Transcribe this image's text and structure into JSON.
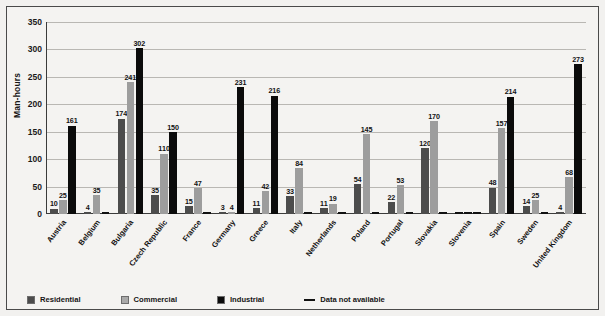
{
  "chart_data": {
    "type": "bar",
    "title": "",
    "xlabel": "",
    "ylabel": "Man-hours",
    "ylim": [
      0,
      350
    ],
    "yticks": [
      0,
      50,
      100,
      150,
      200,
      250,
      300,
      350
    ],
    "ytick_labels": [
      "0",
      "50",
      "100",
      "150",
      "200",
      "250",
      "300",
      "350"
    ],
    "grid": true,
    "legend_position": "bottom-left",
    "na_marker": "Data not available",
    "categories": [
      "Austria",
      "Belgium",
      "Bulgaria",
      "Czech Republic",
      "France",
      "Germany",
      "Greece",
      "Italy",
      "Netherlands",
      "Poland",
      "Portugal",
      "Slovakia",
      "Slovenia",
      "Spain",
      "Sweden",
      "United Kingdom"
    ],
    "series": [
      {
        "name": "Residential",
        "color": "#4c4c4c",
        "values": [
          10,
          4,
          174,
          35,
          15,
          3,
          11,
          33,
          11,
          54,
          22,
          120,
          null,
          48,
          14,
          4
        ]
      },
      {
        "name": "Commercial",
        "color": "#9d9d9d",
        "values": [
          25,
          35,
          241,
          110,
          47,
          4,
          42,
          84,
          19,
          145,
          53,
          170,
          null,
          157,
          25,
          68
        ]
      },
      {
        "name": "Industrial",
        "color": "#0b0b0b",
        "values": [
          161,
          null,
          302,
          150,
          null,
          231,
          216,
          null,
          null,
          null,
          null,
          null,
          null,
          214,
          null,
          273
        ]
      }
    ]
  },
  "legend": {
    "items": [
      {
        "label": "Residential",
        "marker": "swatch-residential"
      },
      {
        "label": "Commercial",
        "marker": "swatch-commercial"
      },
      {
        "label": "Industrial",
        "marker": "swatch-industrial"
      },
      {
        "label": "Data not available",
        "marker": "dash-line"
      }
    ]
  }
}
